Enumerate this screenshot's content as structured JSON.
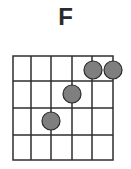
{
  "chord": {
    "name": "F",
    "strings": 6,
    "frets": 4,
    "positions": [
      {
        "string": 3,
        "fret": 3
      },
      {
        "string": 4,
        "fret": 2
      },
      {
        "string": 5,
        "fret": 1
      },
      {
        "string": 6,
        "fret": 1
      }
    ]
  },
  "colors": {
    "grid": "#2e2e2e",
    "dot_fill": "#7f7f7f",
    "dot_stroke": "#2a2a2a",
    "title": "#2b2b2b"
  }
}
